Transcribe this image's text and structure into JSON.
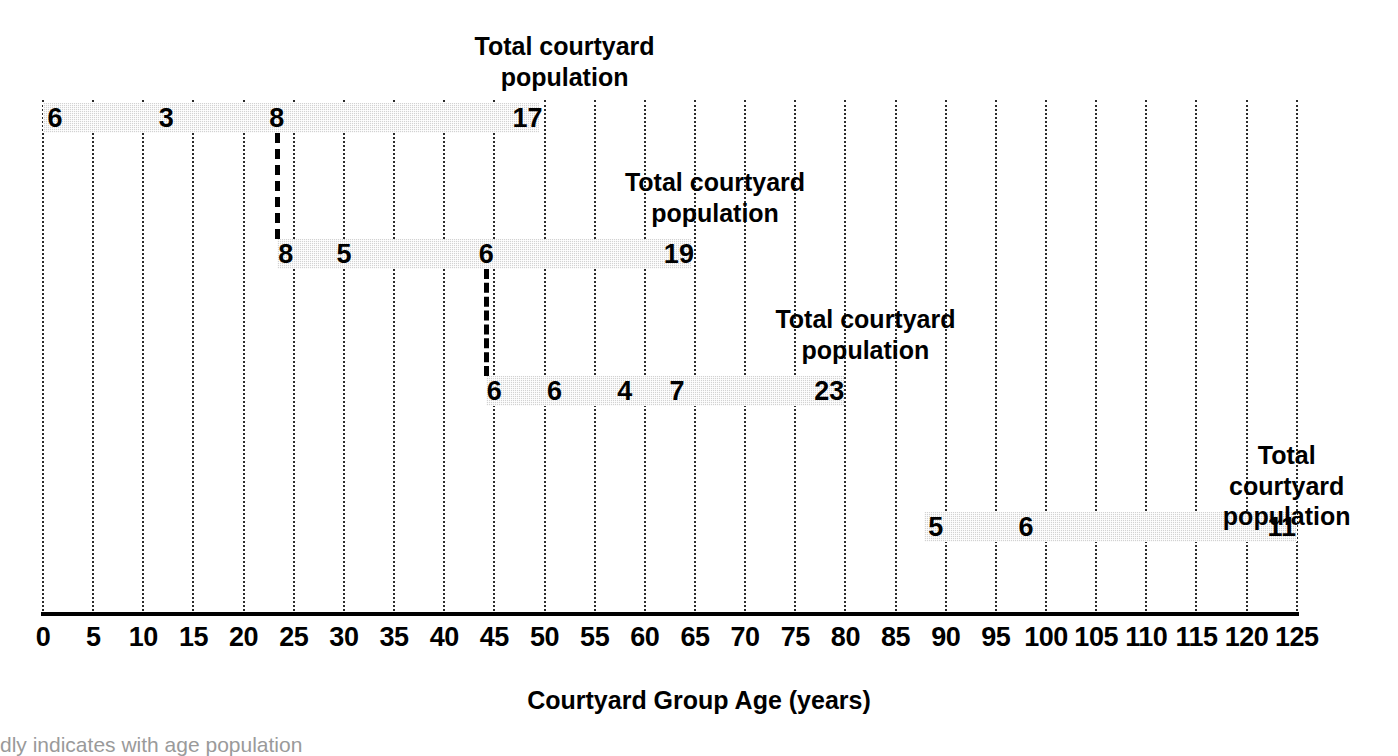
{
  "chart_data": {
    "type": "bar",
    "title": "",
    "xlabel": "Courtyard Group Age (years)",
    "ylabel": "",
    "xlim": [
      0,
      125
    ],
    "xtick_step": 5,
    "grid": true,
    "grid_style": "vertical dotted gridlines every 5 years",
    "legend": "none",
    "orientation": "horizontal-stacked-timeline",
    "xticks": [
      "0",
      "5",
      "10",
      "15",
      "20",
      "25",
      "30",
      "35",
      "40",
      "45",
      "50",
      "55",
      "60",
      "65",
      "70",
      "75",
      "80",
      "85",
      "90",
      "95",
      "100",
      "105",
      "110",
      "115",
      "120",
      "125"
    ],
    "bars": [
      {
        "id": "courtyard-group-1",
        "start": 0,
        "end": 49.5,
        "total": 17,
        "total_label": "Total courtyard\npopulation",
        "total_label_x": 52,
        "segments": [
          {
            "value": 6,
            "x": 1.2
          },
          {
            "value": 3,
            "x": 12.3
          },
          {
            "value": 8,
            "x": 23.3
          },
          {
            "value": 17,
            "x": 48.3
          }
        ]
      },
      {
        "id": "courtyard-group-2",
        "start": 23.3,
        "end": 64.6,
        "total": 19,
        "total_label": "Total courtyard\npopulation",
        "total_label_x": 67,
        "segments": [
          {
            "value": 8,
            "x": 24.2
          },
          {
            "value": 5,
            "x": 30.0
          },
          {
            "value": 6,
            "x": 44.2
          },
          {
            "value": 19,
            "x": 63.4
          }
        ]
      },
      {
        "id": "courtyard-group-3",
        "start": 44.2,
        "end": 79.9,
        "total": 23,
        "total_label": "Total courtyard\npopulation",
        "total_label_x": 82,
        "segments": [
          {
            "value": 6,
            "x": 45.0
          },
          {
            "value": 6,
            "x": 51.0
          },
          {
            "value": 4,
            "x": 58.0
          },
          {
            "value": 7,
            "x": 63.2
          },
          {
            "value": 23,
            "x": 78.4
          }
        ]
      },
      {
        "id": "courtyard-group-4",
        "start": 87.8,
        "end": 125.0,
        "total": 11,
        "total_label": "Total courtyard\npopulation",
        "total_label_x": 124,
        "segments": [
          {
            "value": 5,
            "x": 89.0
          },
          {
            "value": 6,
            "x": 98.0
          },
          {
            "value": 11,
            "x": 123.5
          }
        ]
      }
    ],
    "connectors": [
      {
        "x": 23.3,
        "from_bar": 0,
        "to_bar": 1,
        "style": "dashed"
      },
      {
        "x": 44.2,
        "from_bar": 1,
        "to_bar": 2,
        "style": "dashed"
      }
    ],
    "annotations": [
      "Total courtyard population",
      "Total courtyard population",
      "Total courtyard population",
      "Total courtyard population"
    ]
  },
  "axis": {
    "x_title": "Courtyard Group Age (years)"
  },
  "caption": {
    "text": "dly indicates with age population"
  }
}
